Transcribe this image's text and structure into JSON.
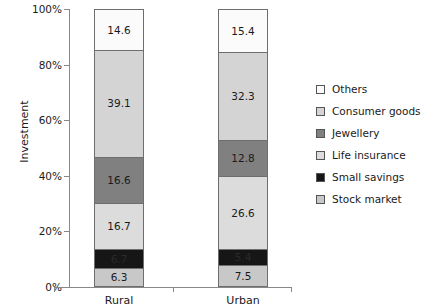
{
  "chart_data": {
    "type": "bar",
    "stacked": true,
    "normalized_percent": true,
    "title": "",
    "xlabel": "",
    "ylabel": "Investment",
    "categories": [
      "Rural",
      "Urban"
    ],
    "ylim": [
      0,
      100
    ],
    "ytick_labels": [
      "0%",
      "20%",
      "40%",
      "60%",
      "80%",
      "100%"
    ],
    "ytick_values": [
      0,
      20,
      40,
      60,
      80,
      100
    ],
    "grid": false,
    "legend_position": "right",
    "series": [
      {
        "name": "Others",
        "color": "#fbfbfb",
        "values": [
          14.6,
          15.4
        ],
        "labels": [
          "14.6",
          "15.4"
        ]
      },
      {
        "name": "Consumer goods",
        "color": "#d4d4d4",
        "values": [
          39.1,
          32.3
        ],
        "labels": [
          "39.1",
          "32.3"
        ]
      },
      {
        "name": "Jewellery",
        "color": "#808080",
        "values": [
          16.6,
          12.8
        ],
        "labels": [
          "16.6",
          "12.8"
        ]
      },
      {
        "name": "Life insurance",
        "color": "#dcdcdc",
        "values": [
          16.7,
          26.6
        ],
        "labels": [
          "16.7",
          "26.6"
        ]
      },
      {
        "name": "Small savings",
        "color": "#161616",
        "values": [
          6.7,
          5.4
        ],
        "labels": [
          "6.7",
          "5.4"
        ]
      },
      {
        "name": "Stock market",
        "color": "#c8c8c8",
        "values": [
          6.3,
          7.5
        ],
        "labels": [
          "6.3",
          "7.5"
        ]
      }
    ],
    "stack_order_top_to_bottom": [
      "Others",
      "Consumer goods",
      "Jewellery",
      "Life insurance",
      "Small savings",
      "Stock market"
    ]
  },
  "axis": {
    "y_title": "Investment"
  },
  "legend": {
    "items": [
      {
        "label": "Others",
        "color": "#fbfbfb"
      },
      {
        "label": "Consumer goods",
        "color": "#d4d4d4"
      },
      {
        "label": "Jewellery",
        "color": "#808080"
      },
      {
        "label": "Life insurance",
        "color": "#dcdcdc"
      },
      {
        "label": "Small savings",
        "color": "#161616"
      },
      {
        "label": "Stock market",
        "color": "#c8c8c8"
      }
    ]
  }
}
